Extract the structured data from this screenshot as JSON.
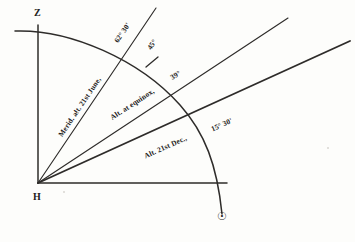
{
  "figure": {
    "kind": "astronomical-altitude-diagram",
    "background_color": "#fdfdfb",
    "ink_color": "#2e2c2a",
    "vertices": {
      "zenith_label": "Z",
      "horizon_label": "H",
      "sun_symbol": "☉"
    },
    "rays": [
      {
        "id": "june",
        "label": "Merid. alt. 21st June,",
        "angle_label": "62° 30'"
      },
      {
        "id": "equinox",
        "label": "Alt. at equinox,",
        "angle_label": "39°"
      },
      {
        "id": "december",
        "label": "Alt. 21st Dec.,",
        "angle_label": "15° 30'"
      }
    ],
    "arc_tick_label": "45°"
  }
}
